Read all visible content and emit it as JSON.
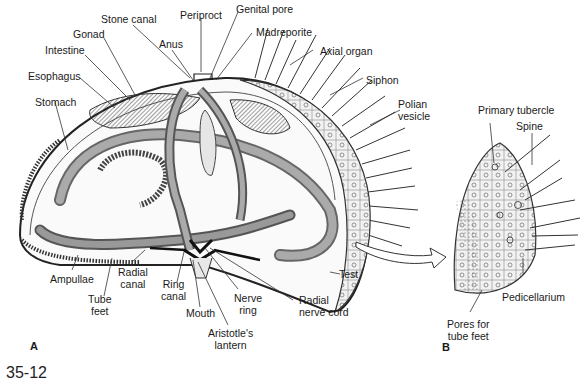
{
  "figure": {
    "number": "35-12",
    "panels": [
      {
        "id": "A",
        "label": "A"
      },
      {
        "id": "B",
        "label": "B"
      }
    ]
  },
  "panel_a": {
    "subject": "sea-urchin-internal-anatomy",
    "labels": {
      "stone_canal": "Stone canal",
      "periproct": "Periproct",
      "genital_pore": "Genital pore",
      "gonad": "Gonad",
      "anus": "Anus",
      "madreporite": "Madreporite",
      "intestine": "Intestine",
      "axial_organ": "Axial organ",
      "esophagus": "Esophagus",
      "siphon": "Siphon",
      "stomach": "Stomach",
      "polian_vesicle_1": "Polian",
      "polian_vesicle_2": "vesicle",
      "test": "Test",
      "ampullae": "Ampullae",
      "radial_canal_1": "Radial",
      "radial_canal_2": "canal",
      "tube_feet_1": "Tube",
      "tube_feet_2": "feet",
      "ring_canal_1": "Ring",
      "ring_canal_2": "canal",
      "mouth": "Mouth",
      "nerve_ring_1": "Nerve",
      "nerve_ring_2": "ring",
      "radial_nerve_cord_1": "Radial",
      "radial_nerve_cord_2": "nerve cord",
      "aristotles_lantern_1": "Aristotle's",
      "aristotles_lantern_2": "lantern"
    }
  },
  "panel_b": {
    "subject": "test-surface-detail",
    "labels": {
      "primary_tubercle": "Primary tubercle",
      "spine": "Spine",
      "pedicellarium": "Pedicellarium",
      "pores_1": "Pores for",
      "pores_2": "tube feet"
    }
  },
  "colors": {
    "line": "#2a2a2a",
    "organ_fill": "#8a8a8a",
    "light_fill": "#d8d8d8",
    "background": "#ffffff"
  }
}
